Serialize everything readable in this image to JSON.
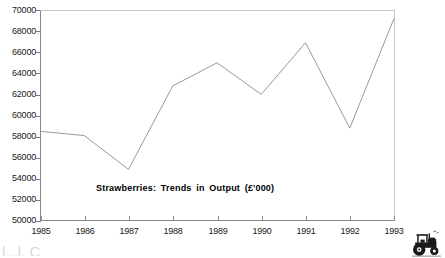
{
  "chart_data": {
    "type": "line",
    "title": "Strawberries:  Trends  in  Output  (£'000)",
    "xlabel": "",
    "ylabel": "",
    "categories": [
      "1985",
      "1986",
      "1987",
      "1988",
      "1989",
      "1990",
      "1991",
      "1992",
      "1993"
    ],
    "values": [
      58500,
      58100,
      54900,
      62800,
      65000,
      62000,
      66900,
      58800,
      69200
    ],
    "series": [
      {
        "name": "Strawberries output",
        "values": [
          58500,
          58100,
          54900,
          62800,
          65000,
          62000,
          66900,
          58800,
          69200
        ]
      }
    ],
    "ylim": [
      50000,
      70000
    ],
    "ytick_step": 2000,
    "ytick_labels": [
      "70000",
      "68000",
      "66000",
      "64000",
      "62000",
      "60000",
      "58000",
      "56000",
      "54000",
      "52000",
      "50000"
    ],
    "xtick_labels": [
      "1985",
      "1986",
      "1987",
      "1988",
      "1989",
      "1990",
      "1991",
      "1992",
      "1993"
    ],
    "grid": false,
    "legend": "none",
    "line_color": "#9a9a9a",
    "axis_color": "#8a8a8a",
    "text_color": "#1a1a1a"
  },
  "decorations": {
    "tractor_icon_name": "tractor-icon",
    "cut_text": "l.,.l. C"
  }
}
